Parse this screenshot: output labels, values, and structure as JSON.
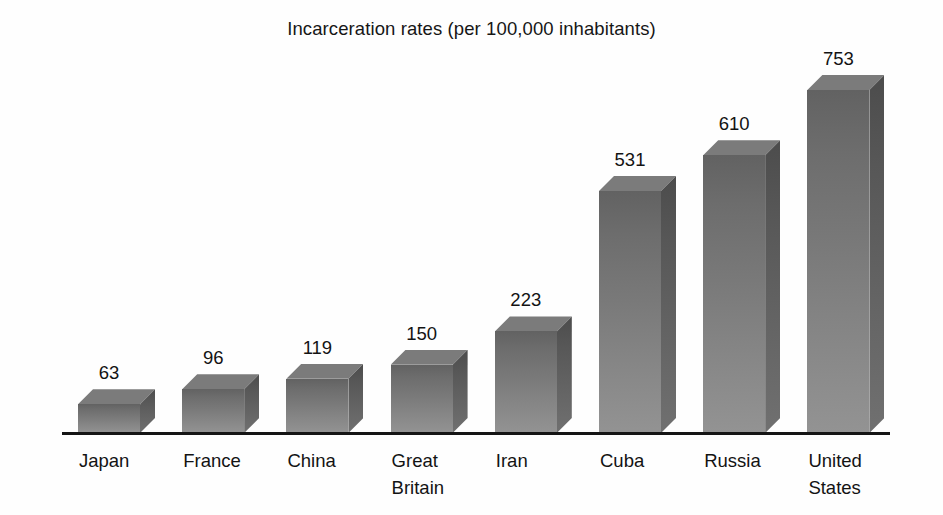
{
  "chart_data": {
    "type": "bar",
    "title": "Incarceration rates (per 100,000 inhabitants)",
    "subtitle": "",
    "xlabel": "",
    "ylabel": "",
    "ylim": [
      0,
      753
    ],
    "grid": false,
    "legend": false,
    "legend_position": "none",
    "style": "3d-bars-grayscale",
    "axis": {
      "baseline_visible": true,
      "y_axis_visible": false,
      "tick_labels_visible": false
    },
    "value_labels_shown": true,
    "categories": [
      "Japan",
      "France",
      "China",
      "Great Britain",
      "Iran",
      "Cuba",
      "Russia",
      "United States"
    ],
    "values": [
      63,
      96,
      119,
      150,
      223,
      531,
      610,
      753
    ],
    "bars": [
      {
        "category": "Japan",
        "category_lines": [
          "Japan"
        ],
        "value": 63,
        "value_label": "63"
      },
      {
        "category": "France",
        "category_lines": [
          "France"
        ],
        "value": 96,
        "value_label": "96"
      },
      {
        "category": "China",
        "category_lines": [
          "China"
        ],
        "value": 119,
        "value_label": "119"
      },
      {
        "category": "Great Britain",
        "category_lines": [
          "Great",
          "Britain"
        ],
        "value": 150,
        "value_label": "150"
      },
      {
        "category": "Iran",
        "category_lines": [
          "Iran"
        ],
        "value": 223,
        "value_label": "223"
      },
      {
        "category": "Cuba",
        "category_lines": [
          "Cuba"
        ],
        "value": 531,
        "value_label": "531"
      },
      {
        "category": "Russia",
        "category_lines": [
          "Russia"
        ],
        "value": 610,
        "value_label": "610"
      },
      {
        "category": "United States",
        "category_lines": [
          "United",
          "States"
        ],
        "value": 753,
        "value_label": "753"
      }
    ]
  },
  "colors": {
    "background": "#ffffff",
    "axis_line": "#151515",
    "text": "#131313",
    "bar_front_top": "#626262",
    "bar_front_bottom": "#939393",
    "bar_side_top": "#4c4c4c",
    "bar_side_bottom": "#707070",
    "bar_top_face": "#7b7b7b"
  }
}
